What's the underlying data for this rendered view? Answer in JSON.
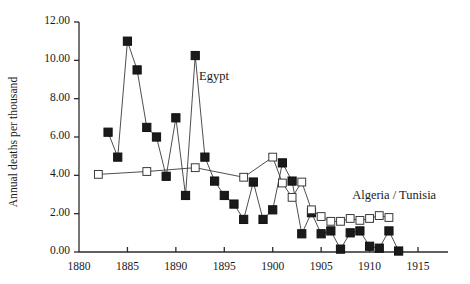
{
  "chart_data": {
    "type": "line",
    "title": "",
    "subtitle": "",
    "xlabel": "",
    "ylabel": "Annual deaths per thousand",
    "xlim": [
      1880,
      1915
    ],
    "ylim": [
      0.0,
      12.0
    ],
    "x_ticks": [
      1880,
      1885,
      1890,
      1895,
      1900,
      1905,
      1910,
      1915
    ],
    "x_tick_labels": [
      "1880",
      "1885",
      "1890",
      "1895",
      "1900",
      "1905",
      "1910",
      "1915"
    ],
    "y_ticks": [
      0.0,
      2.0,
      4.0,
      6.0,
      8.0,
      10.0,
      12.0
    ],
    "y_tick_labels": [
      "0.00",
      "2.00",
      "4.00",
      "6.00",
      "8.00",
      "10.00",
      "12.00"
    ],
    "grid": false,
    "legend_position": "inline-annotations",
    "annotations": [
      {
        "text": "Egypt",
        "x": 1892.4,
        "y": 9.1
      },
      {
        "text": "Algeria / Tunisia",
        "x": 1908.2,
        "y": 2.85
      }
    ],
    "series": [
      {
        "name": "Egypt",
        "marker": "filled-square",
        "color": "#1a1a1a",
        "points": [
          {
            "x": 1883,
            "y": 6.25
          },
          {
            "x": 1884,
            "y": 4.95
          },
          {
            "x": 1885,
            "y": 11.0
          },
          {
            "x": 1886,
            "y": 9.5
          },
          {
            "x": 1887,
            "y": 6.5
          },
          {
            "x": 1888,
            "y": 6.0
          },
          {
            "x": 1889,
            "y": 3.95
          },
          {
            "x": 1890,
            "y": 7.0
          },
          {
            "x": 1891,
            "y": 2.95
          },
          {
            "x": 1892,
            "y": 10.25
          },
          {
            "x": 1893,
            "y": 4.95
          },
          {
            "x": 1894,
            "y": 3.7
          },
          {
            "x": 1895,
            "y": 2.95
          },
          {
            "x": 1896,
            "y": 2.5
          },
          {
            "x": 1897,
            "y": 1.7
          },
          {
            "x": 1898,
            "y": 3.65
          },
          {
            "x": 1899,
            "y": 1.7
          },
          {
            "x": 1900,
            "y": 2.2
          },
          {
            "x": 1901,
            "y": 4.65
          },
          {
            "x": 1902,
            "y": 3.7
          },
          {
            "x": 1903,
            "y": 0.95
          },
          {
            "x": 1904,
            "y": 2.05
          },
          {
            "x": 1905,
            "y": 0.95
          },
          {
            "x": 1906,
            "y": 1.1
          },
          {
            "x": 1907,
            "y": 0.15
          },
          {
            "x": 1908,
            "y": 1.0
          },
          {
            "x": 1909,
            "y": 1.1
          },
          {
            "x": 1910,
            "y": 0.3
          },
          {
            "x": 1911,
            "y": 0.2
          },
          {
            "x": 1912,
            "y": 1.1
          },
          {
            "x": 1913,
            "y": 0.05
          }
        ]
      },
      {
        "name": "Algeria / Tunisia",
        "marker": "open-square",
        "color": "#1a1a1a",
        "points": [
          {
            "x": 1882,
            "y": 4.05
          },
          {
            "x": 1887,
            "y": 4.2
          },
          {
            "x": 1892,
            "y": 4.4
          },
          {
            "x": 1897,
            "y": 3.9
          },
          {
            "x": 1900,
            "y": 4.95
          },
          {
            "x": 1901,
            "y": 3.6
          },
          {
            "x": 1902,
            "y": 2.85
          },
          {
            "x": 1903,
            "y": 3.65
          },
          {
            "x": 1904,
            "y": 2.2
          },
          {
            "x": 1905,
            "y": 1.85
          },
          {
            "x": 1906,
            "y": 1.6
          },
          {
            "x": 1907,
            "y": 1.6
          },
          {
            "x": 1908,
            "y": 1.75
          },
          {
            "x": 1909,
            "y": 1.65
          },
          {
            "x": 1910,
            "y": 1.75
          },
          {
            "x": 1911,
            "y": 1.9
          },
          {
            "x": 1912,
            "y": 1.8
          }
        ]
      }
    ]
  },
  "axis": {
    "y_title": "Annual deaths per thousand"
  }
}
